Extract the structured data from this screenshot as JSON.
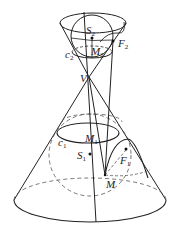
{
  "figure": {
    "labels": {
      "S2": {
        "main": "S",
        "sub": "2"
      },
      "F2": {
        "main": "F",
        "sub": "2"
      },
      "M2": {
        "main": "M",
        "sub": "2"
      },
      "c2": {
        "main": "c",
        "sub": "2"
      },
      "V": {
        "main": "V"
      },
      "M1": {
        "main": "M",
        "sub": "1"
      },
      "c1": {
        "main": "c",
        "sub": "1"
      },
      "S1": {
        "main": "S",
        "sub": "1"
      },
      "F1": {
        "main": "F",
        "sub": "1"
      },
      "M": {
        "main": "M"
      }
    },
    "colors": {
      "stroke": "#222222",
      "dashed": "#555555",
      "background": "#ffffff"
    }
  }
}
